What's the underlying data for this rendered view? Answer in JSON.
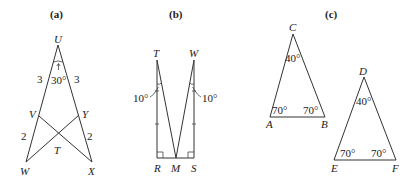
{
  "figures": {
    "a": {
      "caption": "(a)",
      "points": {
        "U": "U",
        "V": "V",
        "Y": "Y",
        "T": "T",
        "W": "W",
        "X": "X"
      },
      "segment_labels": {
        "UV": "3",
        "UY": "3",
        "VW": "2",
        "YX": "2"
      },
      "angle_U": "30°"
    },
    "b": {
      "caption": "(b)",
      "points": {
        "T": "T",
        "W": "W",
        "R": "R",
        "M": "M",
        "S": "S"
      },
      "angle_T": "10°",
      "angle_W": "10°"
    },
    "c": {
      "caption": "(c)",
      "triangle_ABC": {
        "A": "A",
        "B": "B",
        "C": "C",
        "angle_C": "40°",
        "angle_A": "70°",
        "angle_B": "70°"
      },
      "triangle_DEF": {
        "D": "D",
        "E": "E",
        "F": "F",
        "angle_D": "40°",
        "angle_E": "70°",
        "angle_F": "70°"
      }
    }
  }
}
